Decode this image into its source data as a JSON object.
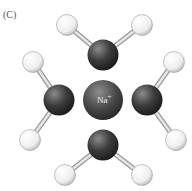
{
  "panel_label": "(C)",
  "ion": {
    "label": "Na",
    "charge": "+"
  },
  "colors": {
    "oxygen": "#3a3a3a",
    "hydrogen": "#f4f4f4",
    "ion": "#4a4a4a",
    "bond": "#c8c8c8"
  },
  "molecules": [
    {
      "name": "water-top",
      "O": [
        103,
        55
      ],
      "H": [
        [
          67,
          25
        ],
        [
          142,
          25
        ]
      ]
    },
    {
      "name": "water-left",
      "O": [
        59,
        100
      ],
      "H": [
        [
          33,
          62
        ],
        [
          30,
          140
        ]
      ]
    },
    {
      "name": "water-right",
      "O": [
        147,
        100
      ],
      "H": [
        [
          174,
          62
        ],
        [
          176,
          140
        ]
      ]
    },
    {
      "name": "water-bottom",
      "O": [
        103,
        145
      ],
      "H": [
        [
          65,
          175
        ],
        [
          142,
          175
        ]
      ]
    }
  ]
}
